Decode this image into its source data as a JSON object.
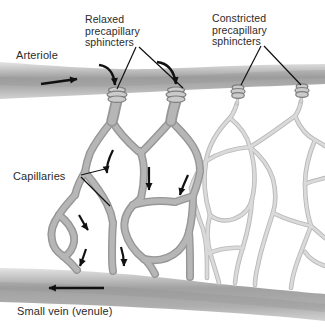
{
  "figure": {
    "labels": {
      "arteriole": "Arteriole",
      "relaxed_sphincters": "Relaxed\nprecapillary\nsphincters",
      "constricted_sphincters": "Constricted\nprecapillary\nsphincters",
      "capillaries": "Capillaries",
      "small_vein": "Small vein (venule)"
    },
    "flow": {
      "arteriole_direction": "right",
      "venule_direction": "left",
      "capillary_bed_direction": "downward (arteriole to venule) through relaxed-sphincter side only"
    },
    "colors": {
      "background": "#ffffff",
      "ink": "#111111",
      "text": "#2b2b2b",
      "vessel_edge_top": "#e4e4e4",
      "vessel_core": "#a1a1a1",
      "vessel_core_low": "#aeaeae",
      "vessel_edge_bottom": "#d2d2d2",
      "vessel_shadow": "#8e8e8e",
      "capillary_perfused": "#b6b6b6",
      "capillary_perfused_outline": "#969696",
      "capillary_unperfused": "#dadada",
      "capillary_unperfused_outline": "#b9b9b9",
      "sphincter_fill": "#cbcbcb",
      "sphincter_outline": "#7d7d7d"
    }
  }
}
